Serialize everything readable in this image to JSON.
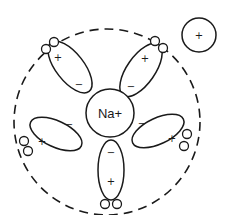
{
  "diagram": {
    "central_ion": {
      "label": "Na+",
      "stroke": "#1a1a1a"
    },
    "hydration_shell": {
      "style": "dashed",
      "stroke": "#1a1a1a"
    },
    "water_molecules": [
      {
        "id": "top-left",
        "near_sign": "−",
        "far_sign": "+"
      },
      {
        "id": "top-right",
        "near_sign": "−",
        "far_sign": "+"
      },
      {
        "id": "left",
        "near_sign": "−",
        "far_sign": "+"
      },
      {
        "id": "right",
        "near_sign": "−",
        "far_sign": "+"
      },
      {
        "id": "bottom",
        "near_sign": "−",
        "far_sign": "+"
      }
    ],
    "free_ion": {
      "sign": "+"
    }
  }
}
